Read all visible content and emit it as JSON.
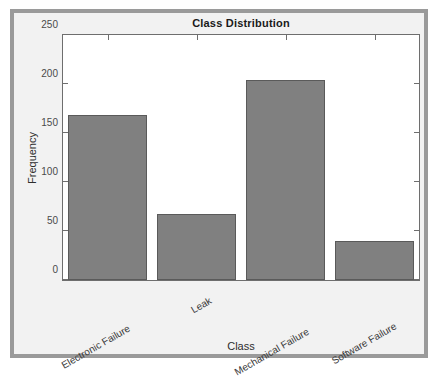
{
  "chart_data": {
    "type": "bar",
    "title": "Class Distribution",
    "xlabel": "Class",
    "ylabel": "Frequency",
    "categories": [
      "Electronic Failure",
      "Leak",
      "Mechanical Failure",
      "Software Failure"
    ],
    "values": [
      168,
      67,
      204,
      40
    ],
    "ylim": [
      0,
      250
    ],
    "yticks": [
      0,
      50,
      100,
      150,
      200,
      250
    ],
    "ytick_labels": [
      "0",
      "50",
      "100",
      "150",
      "200",
      "250"
    ],
    "grid": false,
    "legend": null,
    "bar_color": "#808080",
    "bar_edge_color": "#5a5a5a",
    "axes_color": "#6e6e6e",
    "figure_background": "#f2f2f2",
    "plot_background": "#ffffff",
    "frame_color": "#9a9a9a",
    "xtick_label_rotation": -30
  }
}
